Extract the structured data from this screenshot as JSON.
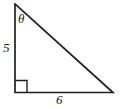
{
  "figure": {
    "type": "right-triangle-diagram",
    "background_color": "#ffffff",
    "stroke_color": "#231f20",
    "stroke_width": 1.6,
    "vertices": {
      "apex_top_left": [
        15,
        4
      ],
      "right_angle_bottom_left": [
        15,
        92.5
      ],
      "bottom_right": [
        113,
        92.5
      ]
    },
    "right_angle_marker": {
      "present": true,
      "at_vertex": "right_angle_bottom_left",
      "size": 12
    },
    "labels": {
      "angle": "θ",
      "leg_vertical": "5",
      "leg_horizontal": "6"
    },
    "measurements": {
      "opposite_side_length": 6,
      "adjacent_side_length": 5,
      "angle_symbol": "θ",
      "angle_location": "top vertex"
    }
  }
}
